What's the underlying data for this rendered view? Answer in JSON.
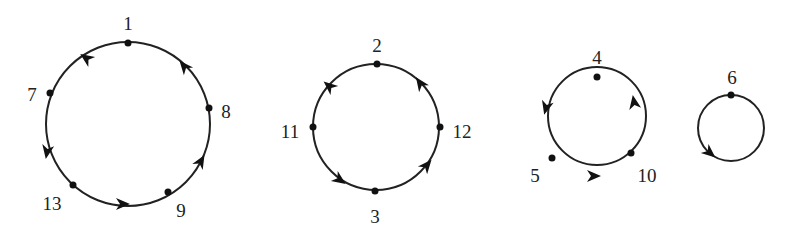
{
  "diagram": {
    "type": "permutation-cycle-decomposition",
    "cycles": [
      {
        "id": "cycle-a",
        "center": [
          128,
          124
        ],
        "radius": 82,
        "nodes": [
          {
            "label": "1",
            "x": 128,
            "y": 43,
            "lx": 128,
            "ly": 26
          },
          {
            "label": "7",
            "x": 50,
            "y": 93,
            "lx": 32,
            "ly": 97
          },
          {
            "label": "13",
            "x": 73,
            "y": 185,
            "lx": 52,
            "ly": 206
          },
          {
            "label": "9",
            "x": 168,
            "y": 192,
            "lx": 181,
            "ly": 213
          },
          {
            "label": "8",
            "x": 209,
            "y": 108,
            "lx": 226,
            "ly": 114
          }
        ],
        "arrows": [
          {
            "x": 86,
            "y": 58,
            "angle": 215
          },
          {
            "x": 47,
            "y": 152,
            "angle": 100
          },
          {
            "x": 123,
            "y": 204,
            "angle": 0
          },
          {
            "x": 201,
            "y": 161,
            "angle": 300
          },
          {
            "x": 184,
            "y": 66,
            "angle": 230
          }
        ]
      },
      {
        "id": "cycle-b",
        "center": [
          376,
          127
        ],
        "radius": 63,
        "nodes": [
          {
            "label": "2",
            "x": 377,
            "y": 64,
            "lx": 377,
            "ly": 48
          },
          {
            "label": "11",
            "x": 313,
            "y": 127,
            "lx": 290,
            "ly": 134
          },
          {
            "label": "3",
            "x": 375,
            "y": 191,
            "lx": 375,
            "ly": 219
          },
          {
            "label": "12",
            "x": 440,
            "y": 127,
            "lx": 462,
            "ly": 134
          }
        ],
        "arrows": [
          {
            "x": 329,
            "y": 86,
            "angle": 220
          },
          {
            "x": 340,
            "y": 180,
            "angle": 35
          },
          {
            "x": 427,
            "y": 165,
            "angle": 310
          },
          {
            "x": 420,
            "y": 83,
            "angle": 235
          }
        ]
      },
      {
        "id": "cycle-c",
        "center": [
          597,
          116
        ],
        "radius": 49,
        "nodes": [
          {
            "label": "4",
            "x": 597,
            "y": 77,
            "lx": 597,
            "ly": 60
          },
          {
            "label": "5",
            "x": 552,
            "y": 158,
            "lx": 535,
            "ly": 178
          },
          {
            "label": "10",
            "x": 631,
            "y": 153,
            "lx": 647,
            "ly": 178
          }
        ],
        "arrows": [
          {
            "x": 546,
            "y": 108,
            "angle": 105
          },
          {
            "x": 594,
            "y": 176,
            "angle": 0
          },
          {
            "x": 634,
            "y": 102,
            "angle": 260
          }
        ]
      },
      {
        "id": "cycle-d",
        "center": [
          731,
          128
        ],
        "radius": 33,
        "nodes": [
          {
            "label": "6",
            "x": 731,
            "y": 95,
            "lx": 732,
            "ly": 80
          }
        ],
        "arrows": [
          {
            "x": 710,
            "y": 153,
            "angle": 40
          }
        ]
      }
    ]
  }
}
